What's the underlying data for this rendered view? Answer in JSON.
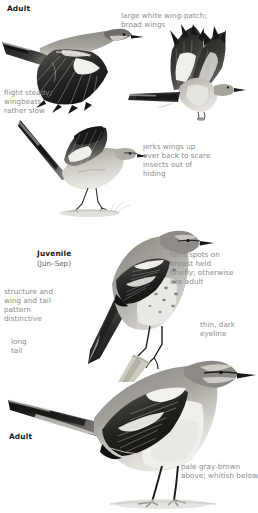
{
  "page": {
    "species": "Northern Mockingbird",
    "width": 258,
    "height": 513,
    "background": "#ffffff"
  },
  "colors": {
    "annotation_text": "#8a8a8a",
    "label_text": "#1a1a1a",
    "sublabel_text": "#5d5d5d",
    "upperpart_gray": "#9a9894",
    "dark_wing": "#2b2b2b",
    "wing_black": "#1e1e1e",
    "underpart_white": "#efede8",
    "pale_buff": "#d8d4cb",
    "mid_gray": "#7d7b77",
    "branch_brown": "#b9b3a6"
  },
  "labels": {
    "adult_top": "Adult",
    "juvenile": "Juvenile",
    "juvenile_months": "(Jun–Sep)",
    "adult_bottom": "Adult"
  },
  "annotations": {
    "wing_patch": "large white wing-patch;\nbroad wings",
    "flight": "flight steady;\nwingbeats\nrather slow",
    "wing_flash": "jerks wings up\nover back to scare\ninsects out of\nhiding",
    "breast_spots": "faint spots on\nbreast held\nbriefly; otherwise\nlike adult",
    "structure": "structure and\nwing and tail\npattern\ndistinctive",
    "eyeline": "thin, dark\neyeline",
    "long_tail": "long\ntail",
    "plumage": "pale gray-brown\nabove; whitish below"
  },
  "figures": [
    {
      "id": "flying-bird-side",
      "name": "adult-in-flight-side-view",
      "pose": "gliding, wings spread downward, white wing patch visible"
    },
    {
      "id": "flying-bird-front",
      "name": "adult-in-flight-front-view",
      "pose": "wings raised above back, white wing patches, tail spread"
    },
    {
      "id": "wing-flash-bird",
      "name": "adult-wing-flashing-display",
      "pose": "standing on ground with wings jerked up over back"
    },
    {
      "id": "juvenile-perched",
      "name": "juvenile-perched-on-branch",
      "pose": "perched upright on branch, spotted breast"
    },
    {
      "id": "adult-perched",
      "name": "adult-perched-on-ground",
      "pose": "standing, long tail, white wing bars"
    }
  ]
}
